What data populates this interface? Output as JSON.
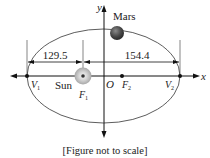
{
  "diagram": {
    "type": "ellipse-orbit",
    "labels": {
      "y_axis": "y",
      "x_axis": "x",
      "planet": "Mars",
      "star": "Sun",
      "origin": "O",
      "focus1": "F",
      "focus1_sub": "1",
      "focus2": "F",
      "focus2_sub": "2",
      "vertex1": "V",
      "vertex1_sub": "1",
      "vertex2": "V",
      "vertex2_sub": "2"
    },
    "dimensions": {
      "left": "129.5",
      "right": "154.4"
    },
    "caption": "[Figure not to scale]"
  }
}
